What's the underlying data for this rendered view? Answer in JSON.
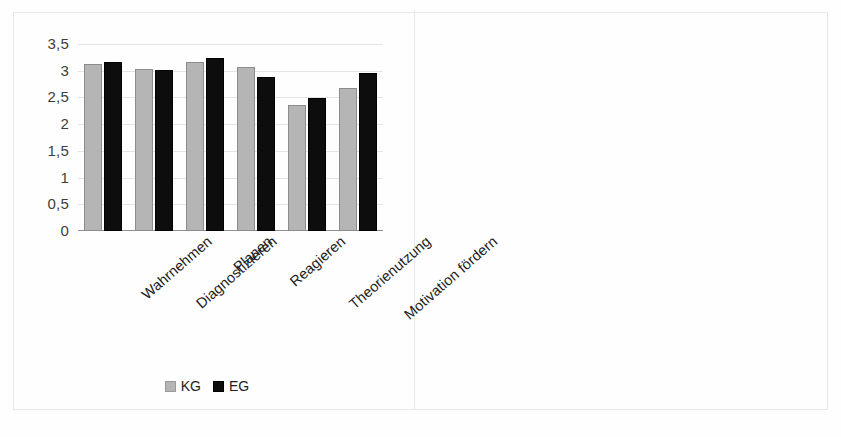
{
  "figure": {
    "background": "#ffffff",
    "panel_divider": true
  },
  "colors": {
    "kg_gray": "#b5b5b5",
    "eg_black": "#0d0d0d",
    "gridline": "#e4e4e4",
    "axis": "#8f8f8f",
    "text": "#1d1d1d",
    "tick_text": "#3e3e3e"
  },
  "chart_data": [
    {
      "type": "bar",
      "id": "left-chart",
      "title": "",
      "xlabel": "",
      "ylabel": "",
      "ylim": [
        0,
        3.5
      ],
      "ytick_labels": [
        "0",
        "0,5",
        "1",
        "1,5",
        "2",
        "2,5",
        "3",
        "3,5"
      ],
      "ytick_values": [
        0,
        0.5,
        1,
        1.5,
        2,
        2.5,
        3,
        3.5
      ],
      "grid": true,
      "legend": "bottom-center",
      "categories": [
        "Wahrnehmen",
        "Diagnostizieren",
        "Planen",
        "Reagieren",
        "Theorienutzung",
        "Motivation fördern"
      ],
      "series": [
        {
          "name": "KG",
          "color": "#b5b5b5",
          "values": [
            3.13,
            3.04,
            3.16,
            3.07,
            2.35,
            2.68
          ]
        },
        {
          "name": "EG",
          "color": "#0d0d0d",
          "values": [
            3.16,
            3.02,
            3.24,
            2.89,
            2.49,
            2.96
          ]
        }
      ]
    },
    {
      "type": "bar",
      "id": "right-chart",
      "title": "",
      "xlabel": "",
      "ylabel": "",
      "ylim": [
        0,
        25
      ],
      "ytick_labels": [
        "0",
        "5",
        "10",
        "15",
        "20",
        "25"
      ],
      "ytick_values": [
        0,
        5,
        10,
        15,
        20,
        25
      ],
      "grid": true,
      "legend": "none",
      "categories": [
        "Wahrnehmen",
        "Diagnostizieren",
        "Planen",
        "Reagieren",
        "Theorienutzung",
        "Motivationfördern"
      ],
      "series": [
        {
          "name": "",
          "color": "#b0b0b0",
          "values": [
            18,
            8,
            21,
            4,
            3,
            4
          ]
        }
      ]
    }
  ]
}
